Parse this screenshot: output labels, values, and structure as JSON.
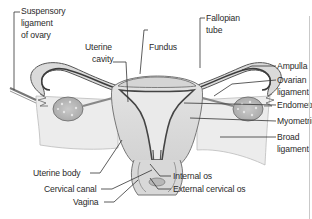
{
  "diagram": {
    "colors": {
      "tissue_light": "#e6e6e6",
      "tissue_mid": "#cfcfcf",
      "tissue_dark": "#5a5a5a",
      "ovary": "#bdbdbd",
      "ovary_spots": "#e4e4e4",
      "leader_line": "#333333",
      "text": "#2a2a2a"
    },
    "labels": {
      "suspensory_line1": "Suspensory",
      "suspensory_line2": "ligament",
      "suspensory_line3": "of ovary",
      "uterine_cavity_line1": "Uterine",
      "uterine_cavity_line2": "cavity",
      "fundus": "Fundus",
      "fallopian_line1": "Fallopian",
      "fallopian_line2": "tube",
      "ampulla": "Ampulla",
      "ovarian_line1": "Ovarian",
      "ovarian_line2": "ligament",
      "endometrium": "Endometrium",
      "myometrium": "Myometrium",
      "broad_line1": "Broad",
      "broad_line2": "ligament",
      "uterine_body": "Uterine body",
      "cervical_canal": "Cervical canal",
      "vagina": "Vagina",
      "internal_os": "Internal os",
      "external_os": "External cervical os"
    }
  }
}
